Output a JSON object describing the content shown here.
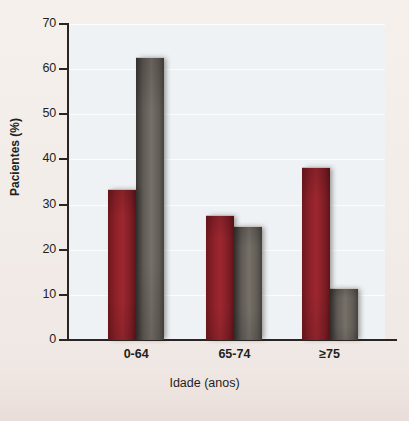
{
  "chart_data": {
    "type": "bar",
    "title": "",
    "xlabel": "Idade (anos)",
    "ylabel": "Pacientes (%)",
    "categories": [
      "0-64",
      "65-74",
      "≥75"
    ],
    "series": [
      {
        "name": "serie-vermelha",
        "color": "#8e2129",
        "values": [
          33.5,
          27.7,
          38.3
        ]
      },
      {
        "name": "serie-cinza",
        "color": "#6b6560",
        "values": [
          62.7,
          25.3,
          11.5
        ]
      }
    ],
    "ylim": [
      0,
      70
    ],
    "yticks": [
      0,
      10,
      20,
      30,
      40,
      50,
      60,
      70
    ],
    "ytick_labels": [
      "0",
      "10",
      "20",
      "30",
      "40",
      "50",
      "60",
      "70"
    ],
    "grid": true,
    "grid_axis": "y",
    "legend": "none",
    "plot_background": "#eef2f4",
    "page_background": "#f2ece8"
  }
}
